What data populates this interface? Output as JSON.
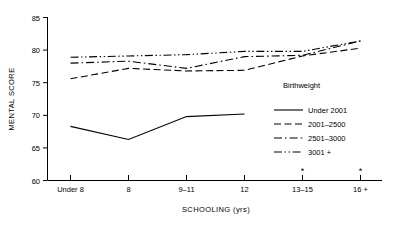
{
  "chart_data": {
    "type": "line",
    "title": "",
    "xlabel": "SCHOOLING (yrs)",
    "ylabel": "MENTAL SCORE",
    "categories": [
      "Under 8",
      "8",
      "9–11",
      "12",
      "13–15",
      "16 +"
    ],
    "ylim": [
      60,
      85
    ],
    "yticks": [
      60,
      65,
      70,
      75,
      80,
      85
    ],
    "ytick_labels": [
      "60",
      "65",
      "70",
      "75",
      "80",
      "85"
    ],
    "grid": false,
    "legend_position": "inside-lower-right",
    "legend_title": "Birthweight",
    "annotations": [
      {
        "text": "*",
        "category": "13–15",
        "note": "asterisk above axis at 13-15"
      },
      {
        "text": "*",
        "category": "16 +",
        "note": "asterisk above axis at 16 +"
      }
    ],
    "series": [
      {
        "name": "Under 2001",
        "style": "solid",
        "values": [
          68.3,
          66.3,
          69.8,
          70.2,
          null,
          null
        ]
      },
      {
        "name": "2001–2500",
        "style": "dashed",
        "values": [
          75.6,
          77.2,
          76.8,
          76.9,
          79.1,
          80.3
        ]
      },
      {
        "name": "2501–3000",
        "style": "dash-dot",
        "values": [
          78.0,
          78.3,
          77.2,
          79.0,
          79.2,
          81.4
        ]
      },
      {
        "name": "3001 +",
        "style": "dash-dot-dot",
        "values": [
          78.9,
          79.1,
          79.3,
          79.8,
          79.8,
          81.4
        ]
      }
    ]
  },
  "axes": {
    "y_title": "MENTAL SCORE",
    "x_title": "SCHOOLING (yrs)",
    "y_tick_0": "60",
    "y_tick_1": "65",
    "y_tick_2": "70",
    "y_tick_3": "75",
    "y_tick_4": "80",
    "y_tick_5": "85",
    "x_tick_0": "Under 8",
    "x_tick_1": "8",
    "x_tick_2": "9–11",
    "x_tick_3": "12",
    "x_tick_4": "13–15",
    "x_tick_5": "16 +"
  },
  "legend": {
    "title": "Birthweight",
    "items": [
      {
        "label": "Under 2001",
        "style": "solid"
      },
      {
        "label": "2001–2500",
        "style": "dashed"
      },
      {
        "label": "2501–3000",
        "style": "dash-dot"
      },
      {
        "label": "3001 +",
        "style": "dash-dot-dot"
      }
    ]
  },
  "marks": {
    "asterisk": "*"
  },
  "colors": {
    "background": "#ffffff",
    "ink": "#000000"
  }
}
